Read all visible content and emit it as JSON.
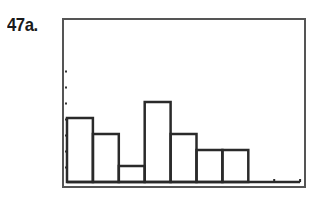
{
  "exercise": {
    "label": "47a."
  },
  "chart_data": {
    "type": "bar",
    "subtype": "histogram",
    "title": "",
    "xlabel": "",
    "ylabel": "",
    "categories": [
      "bin1",
      "bin2",
      "bin3",
      "bin4",
      "bin5",
      "bin6",
      "bin7",
      "bin8",
      "bin9"
    ],
    "values": [
      4,
      3,
      1,
      5,
      3,
      2,
      2,
      0,
      0
    ],
    "ylim": [
      0,
      6
    ],
    "y_tick_marks": 7,
    "grid": false,
    "legend": null,
    "style": "graphing-calculator screen, outlined bars"
  },
  "colors": {
    "bar_stroke": "#2a2a2a",
    "frame": "#555555",
    "background": "#ffffff"
  }
}
